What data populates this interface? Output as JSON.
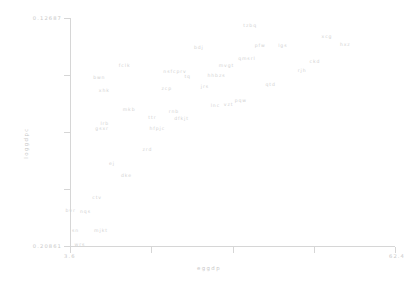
{
  "chart_data": {
    "type": "scatter",
    "title": "",
    "xlabel": "eggdp",
    "ylabel": "loggdpc",
    "xlim": [
      3.6,
      62.4
    ],
    "ylim": [
      0.12687,
      0.20861
    ],
    "grid": false,
    "legend": null,
    "xticklabels": [
      "3.6",
      "",
      "",
      "",
      "62.4"
    ],
    "yticklabels": [
      "0.20861",
      "",
      "",
      "",
      "0.12687"
    ],
    "xtick_values": [
      3.6,
      18.3,
      33.0,
      47.7,
      62.4
    ],
    "ytick_values": [
      0.20861,
      0.18818,
      0.16774,
      0.14731,
      0.12687
    ],
    "marker_style": "text-label",
    "points": [
      {
        "label": "wrs",
        "x": 5.4,
        "y": 0.20805
      },
      {
        "label": "sn",
        "x": 4.6,
        "y": 0.20295
      },
      {
        "label": "mjkt",
        "x": 9.2,
        "y": 0.20275
      },
      {
        "label": "bvr",
        "x": 3.7,
        "y": 0.1957
      },
      {
        "label": "nqs",
        "x": 6.4,
        "y": 0.1961
      },
      {
        "label": "ctv",
        "x": 8.5,
        "y": 0.1912
      },
      {
        "label": "dke",
        "x": 13.8,
        "y": 0.1832
      },
      {
        "label": "ej",
        "x": 11.2,
        "y": 0.179
      },
      {
        "label": "zrd",
        "x": 17.6,
        "y": 0.1739
      },
      {
        "label": "gsxr",
        "x": 9.4,
        "y": 0.1664
      },
      {
        "label": "lrb",
        "x": 9.9,
        "y": 0.1645
      },
      {
        "label": "hfpjc",
        "x": 19.4,
        "y": 0.1664
      },
      {
        "label": "ttr",
        "x": 18.5,
        "y": 0.1622
      },
      {
        "label": "dfkjt",
        "x": 23.8,
        "y": 0.1628
      },
      {
        "label": "rnb",
        "x": 22.4,
        "y": 0.1603
      },
      {
        "label": "mkb",
        "x": 14.3,
        "y": 0.1593
      },
      {
        "label": "vzt",
        "x": 32.3,
        "y": 0.1576
      },
      {
        "label": "lnc",
        "x": 29.9,
        "y": 0.1579
      },
      {
        "label": "pqw",
        "x": 34.5,
        "y": 0.1562
      },
      {
        "label": "xhk",
        "x": 9.8,
        "y": 0.1527
      },
      {
        "label": "zcp",
        "x": 21.1,
        "y": 0.152
      },
      {
        "label": "jrs",
        "x": 28.0,
        "y": 0.1512
      },
      {
        "label": "qtd",
        "x": 39.9,
        "y": 0.1506
      },
      {
        "label": "bwn",
        "x": 8.9,
        "y": 0.148
      },
      {
        "label": "tq",
        "x": 24.9,
        "y": 0.1476
      },
      {
        "label": "hhbzs",
        "x": 30.1,
        "y": 0.1474
      },
      {
        "label": "nsfcprv",
        "x": 22.6,
        "y": 0.1457
      },
      {
        "label": "fclk",
        "x": 13.5,
        "y": 0.1436
      },
      {
        "label": "mvgt",
        "x": 31.9,
        "y": 0.1438
      },
      {
        "label": "qmsrl",
        "x": 35.6,
        "y": 0.1412
      },
      {
        "label": "rjh",
        "x": 45.6,
        "y": 0.1456
      },
      {
        "label": "ckd",
        "x": 47.9,
        "y": 0.1423
      },
      {
        "label": "bdj",
        "x": 26.9,
        "y": 0.1374
      },
      {
        "label": "pfw",
        "x": 38.0,
        "y": 0.1367
      },
      {
        "label": "lgs",
        "x": 42.1,
        "y": 0.1365
      },
      {
        "label": "hxz",
        "x": 53.4,
        "y": 0.1362
      },
      {
        "label": "tzbq",
        "x": 36.2,
        "y": 0.1293
      },
      {
        "label": "xcg",
        "x": 50.1,
        "y": 0.1332
      }
    ]
  }
}
